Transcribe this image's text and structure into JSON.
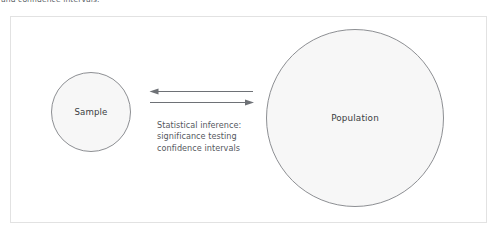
{
  "caption": {
    "text": "and confidence intervals."
  },
  "figure": {
    "nodes": {
      "sample": {
        "label": "Sample"
      },
      "population": {
        "label": "Population"
      }
    },
    "connector": {
      "arrow_left_name": "arrow-pointing-to-sample",
      "arrow_right_name": "arrow-pointing-to-population",
      "note_lines": [
        "Statistical inference:",
        "significance testing",
        "confidence intervals"
      ]
    },
    "colors": {
      "circle_fill": "#f7f7f7",
      "circle_stroke": "#8d8f93",
      "frame_border": "#e2e2e2",
      "arrow": "#6e7176",
      "text": "#3a3d42",
      "note_text": "#55585e"
    }
  }
}
